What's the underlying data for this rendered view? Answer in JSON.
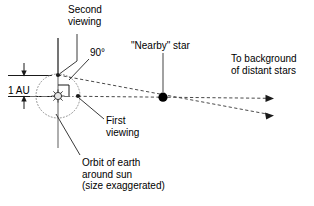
{
  "diagram": {
    "labels": {
      "second_viewing": "Second\nviewing",
      "angle_right": "90°",
      "one_au": "1 AU",
      "nearby_star": "\"Nearby\" star",
      "to_background": "To background\nof distant stars",
      "first_viewing": "First\nviewing",
      "orbit_caption": "Orbit of earth\naround sun\n(size exaggerated)"
    },
    "colors": {
      "ink": "#1a1a1a",
      "dash": "#555555",
      "guide": "#8c8c8c",
      "orbit": "#9a9a9a",
      "star_fill": "#000000",
      "background": "#ffffff"
    },
    "geometry": {
      "sun": {
        "x": 58,
        "y": 96,
        "symbol": "sun-rays"
      },
      "orbit": {
        "cx": 58,
        "cy": 96,
        "r": 22,
        "style": "dotted"
      },
      "earth_second_viewing": {
        "x": 58,
        "y": 75
      },
      "earth_first_viewing": {
        "x": 78,
        "y": 96
      },
      "nearby_star": {
        "x": 163,
        "y": 97,
        "r": 4.5
      },
      "sightline_first": {
        "from_x": 78,
        "from_y": 96,
        "to_x": 270,
        "to_y": 98
      },
      "sightline_second": {
        "from_x": 58,
        "from_y": 75,
        "to_x": 272,
        "to_y": 115
      },
      "right_angle_marker": {
        "x": 58,
        "y": 85,
        "size": 11
      },
      "vertical_guide": {
        "x": 58,
        "y1": 38,
        "y2": 148
      },
      "au_dimension": {
        "x": 24,
        "y_top": 76,
        "y_bottom": 96
      }
    }
  }
}
